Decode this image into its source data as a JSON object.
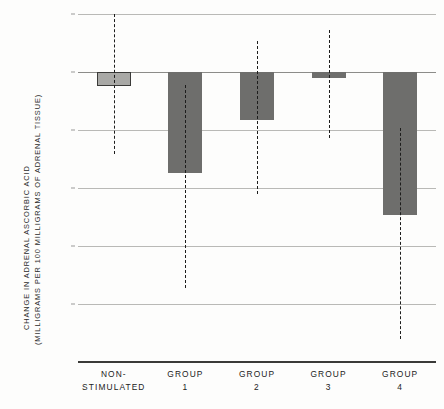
{
  "chart_data": {
    "type": "bar",
    "title": "",
    "subtitle": "",
    "xlabel": "",
    "ylabel": "CHANGE IN ADRENAL ASCORBIC ACID (MILLIGRAMS PER 100 MILLIGRAMS OF ADRENAL TISSUE)",
    "ylabel_lines": [
      "CHANGE IN ADRENAL ASCORBIC ACID",
      "(MILLIGRAMS PER 100 MILLIGRAMS OF ADRENAL TISSUE)"
    ],
    "ylim": [
      -250,
      50
    ],
    "yticks": [
      50,
      0,
      -50,
      -100,
      -150,
      -200,
      -250
    ],
    "ytick_labels": [
      "+50",
      "0",
      "-50",
      "-100",
      "-150",
      "-200",
      "-250"
    ],
    "grid": true,
    "legend": "none",
    "categories": [
      [
        "NON-",
        "STIMULATED"
      ],
      [
        "GROUP",
        "1"
      ],
      [
        "GROUP",
        "2"
      ],
      [
        "GROUP",
        "3"
      ],
      [
        "GROUP",
        "4"
      ]
    ],
    "category_labels": [
      "NON-STIMULATED",
      "GROUP 1",
      "GROUP 2",
      "GROUP 3",
      "GROUP 4"
    ],
    "values": [
      -12,
      -87,
      -41,
      -5,
      -123
    ],
    "error_high": [
      50,
      -11,
      27,
      36,
      -48
    ],
    "error_low": [
      -71,
      -186,
      -105,
      -57,
      -230
    ],
    "series": [
      {
        "name": "Change in adrenal ascorbic acid",
        "values": [
          -12,
          -87,
          -41,
          -5,
          -123
        ]
      }
    ],
    "bar_styles": [
      "light-gray-outlined",
      "solid-gray",
      "solid-gray",
      "solid-gray",
      "solid-gray"
    ],
    "colors": {
      "bar_solid": "#6e6e6c",
      "bar_light": "#a9a9a6",
      "bar_light_outline": "#3b3b39",
      "whisker": "#1d1d1c",
      "gridline": "#b9b9b6",
      "zero_line": "#8c8c89",
      "baseline": "#3a3a38",
      "text": "#222222",
      "background": "#fdfdfc"
    }
  }
}
